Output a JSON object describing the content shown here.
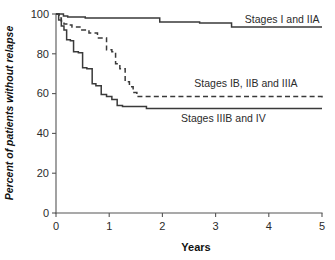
{
  "chart_data": {
    "type": "line",
    "title": "",
    "subtitle": "",
    "xlabel": "Years",
    "ylabel": "Percent of patients without relapse",
    "xlim": [
      0,
      5
    ],
    "ylim": [
      0,
      100
    ],
    "xticks": [
      0,
      1,
      2,
      3,
      4,
      5
    ],
    "yticks": [
      0,
      20,
      40,
      60,
      80,
      100
    ],
    "xtick_labels": [
      "0",
      "1",
      "2",
      "3",
      "4",
      "5"
    ],
    "ytick_labels": [
      "0",
      "20",
      "40",
      "60",
      "80",
      "100"
    ],
    "grid": false,
    "legend_position": "inline-right-of-curves",
    "step_style": "post",
    "series": [
      {
        "name": "Stages I and IIA",
        "label": "Stages I and IIA",
        "style": "solid",
        "color": "#3a3a3a",
        "label_x": 3.55,
        "label_y": 95.5,
        "x": [
          0.0,
          0.08,
          0.14,
          0.22,
          0.55,
          1.95,
          2.7,
          3.3,
          5.0
        ],
        "y": [
          100,
          100,
          99,
          98.5,
          98,
          96,
          95.5,
          93.5,
          93.5
        ],
        "final_value": 93.5
      },
      {
        "name": "Stages IB, IIB and IIIA",
        "label": "Stages IB, IIB and IIIA",
        "style": "dashed",
        "color": "#3a3a3a",
        "label_x": 2.6,
        "label_y": 63.5,
        "x": [
          0.0,
          0.06,
          0.1,
          0.15,
          0.22,
          0.3,
          0.45,
          0.62,
          0.78,
          0.95,
          1.05,
          1.12,
          1.2,
          1.3,
          1.38,
          1.45,
          1.52,
          3.1,
          5.0
        ],
        "y": [
          100,
          98,
          96.5,
          95,
          94.5,
          93.5,
          92,
          90.5,
          88,
          82,
          81,
          75,
          72.5,
          66,
          63.5,
          60.5,
          58.5,
          58.5,
          57
        ],
        "final_value": 57
      },
      {
        "name": "Stages IIIB and IV",
        "label": "Stages IIIB and IV",
        "style": "solid",
        "color": "#3a3a3a",
        "label_x": 2.35,
        "label_y": 45.5,
        "x": [
          0.0,
          0.05,
          0.1,
          0.15,
          0.2,
          0.27,
          0.33,
          0.42,
          0.5,
          0.58,
          0.68,
          0.75,
          0.85,
          0.95,
          1.05,
          1.15,
          1.25,
          1.7,
          5.0
        ],
        "y": [
          100,
          97,
          94,
          92,
          87,
          86.5,
          81,
          80.5,
          73,
          72.5,
          65,
          64,
          59.5,
          58.5,
          57,
          54,
          53.5,
          52.5,
          52.5
        ],
        "final_value": 52.5
      }
    ]
  },
  "axis": {
    "xlabel": "Years",
    "ylabel": "Percent of patients without relapse"
  }
}
